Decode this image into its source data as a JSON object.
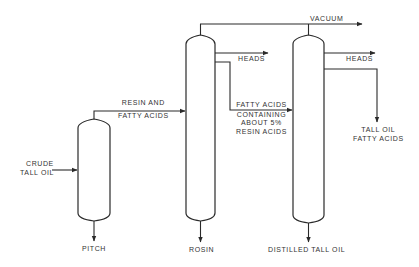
{
  "diagram": {
    "type": "process-flow",
    "colors": {
      "line": "#2a2a2a",
      "text": "#333333",
      "background": "#ffffff"
    },
    "vessels": [
      {
        "id": "pitch-column",
        "name": "Pitch column"
      },
      {
        "id": "rosin-column",
        "name": "Rosin column"
      },
      {
        "id": "fatty-acid-column",
        "name": "Distilled tall oil column"
      }
    ],
    "labels": {
      "crude_tall_oil_1": "CRUDE",
      "crude_tall_oil_2": "TALL OIL",
      "resin_fatty_1": "RESIN AND",
      "resin_fatty_2": "FATTY ACIDS",
      "pitch": "PITCH",
      "vacuum": "VACUUM",
      "heads_1": "HEADS",
      "heads_2": "HEADS",
      "fatty_resin_1": "FATTY ACIDS",
      "fatty_resin_2": "CONTAINING",
      "fatty_resin_3": "ABOUT 5%",
      "fatty_resin_4": "RESIN ACIDS",
      "rosin": "ROSIN",
      "distilled_tall_oil": "DISTILLED TALL OIL",
      "tofa_1": "TALL OIL",
      "tofa_2": "FATTY ACIDS"
    },
    "streams": [
      {
        "from": "feed",
        "to": "pitch-column",
        "label": "CRUDE TALL OIL"
      },
      {
        "from": "pitch-column",
        "to": "rosin-column",
        "label": "RESIN AND FATTY ACIDS"
      },
      {
        "from": "pitch-column",
        "to": "out",
        "label": "PITCH"
      },
      {
        "from": "rosin-column",
        "to": "out",
        "label": "HEADS"
      },
      {
        "from": "rosin-column",
        "to": "fatty-acid-column",
        "label": "FATTY ACIDS CONTAINING ABOUT 5% RESIN ACIDS"
      },
      {
        "from": "rosin-column",
        "to": "out",
        "label": "ROSIN"
      },
      {
        "from": "rosin-column+fatty-acid-column",
        "to": "vacuum",
        "label": "VACUUM"
      },
      {
        "from": "fatty-acid-column",
        "to": "out",
        "label": "HEADS"
      },
      {
        "from": "fatty-acid-column",
        "to": "out",
        "label": "TALL OIL FATTY ACIDS"
      },
      {
        "from": "fatty-acid-column",
        "to": "out",
        "label": "DISTILLED TALL OIL"
      }
    ]
  }
}
